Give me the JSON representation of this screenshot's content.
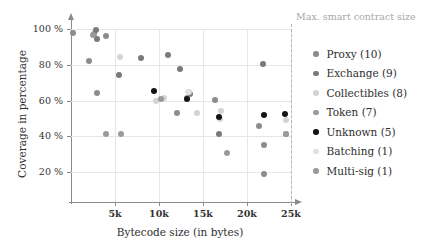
{
  "chart_data": {
    "type": "scatter",
    "title": "",
    "xlabel": "Bytecode size (in bytes)",
    "ylabel": "Coverage in percentage",
    "xlim": [
      0,
      25500
    ],
    "ylim": [
      0,
      108
    ],
    "grid": true,
    "legend_position": "right",
    "xticks": [
      {
        "value": 5000,
        "label": "5k"
      },
      {
        "value": 10000,
        "label": "10k"
      },
      {
        "value": 15000,
        "label": "15k"
      },
      {
        "value": 20000,
        "label": "20k"
      },
      {
        "value": 25000,
        "label": "25k"
      }
    ],
    "yticks": [
      {
        "value": 20,
        "label": "20 %"
      },
      {
        "value": 40,
        "label": "40 %"
      },
      {
        "value": 60,
        "label": "60 %"
      },
      {
        "value": 80,
        "label": "80 %"
      },
      {
        "value": 100,
        "label": "100 %"
      }
    ],
    "annotations": [
      {
        "name": "max-smart-contract-size",
        "text": "Max. smart contract size",
        "type": "vertical-line",
        "x": 25000,
        "color": "#b9b9b9",
        "style": "dashed"
      }
    ],
    "series": [
      {
        "name": "Proxy",
        "count": 10,
        "legend_label": "Proxy (10)",
        "color": "#8c8c8c",
        "points": [
          {
            "x": 250,
            "y": 98
          },
          {
            "x": 2000,
            "y": 82
          },
          {
            "x": 2600,
            "y": 97
          },
          {
            "x": 3000,
            "y": 64
          },
          {
            "x": 4000,
            "y": 96
          },
          {
            "x": 12000,
            "y": 53
          },
          {
            "x": 16400,
            "y": 60.5
          },
          {
            "x": 21400,
            "y": 45.5
          },
          {
            "x": 21900,
            "y": 35
          },
          {
            "x": 21900,
            "y": 19
          }
        ]
      },
      {
        "name": "Exchange",
        "count": 9,
        "legend_label": "Exchange (9)",
        "color": "#7a7a7a",
        "points": [
          {
            "x": 2800,
            "y": 99.5
          },
          {
            "x": 3000,
            "y": 94.5
          },
          {
            "x": 5500,
            "y": 74
          },
          {
            "x": 8000,
            "y": 83.5
          },
          {
            "x": 11000,
            "y": 85.5
          },
          {
            "x": 12400,
            "y": 77.5
          },
          {
            "x": 13500,
            "y": 63.5
          },
          {
            "x": 16800,
            "y": 41
          },
          {
            "x": 21800,
            "y": 80.5
          }
        ]
      },
      {
        "name": "Collectibles",
        "count": 8,
        "legend_label": "Collectibles (8)",
        "color": "#d4d4d4",
        "points": [
          {
            "x": 5600,
            "y": 84.5
          },
          {
            "x": 9700,
            "y": 60
          },
          {
            "x": 10600,
            "y": 61.5
          },
          {
            "x": 13400,
            "y": 64.5
          },
          {
            "x": 14300,
            "y": 53
          },
          {
            "x": 16900,
            "y": 49.5
          },
          {
            "x": 17000,
            "y": 54
          },
          {
            "x": 24400,
            "y": 49
          }
        ]
      },
      {
        "name": "Token",
        "count": 7,
        "legend_label": "Token (7)",
        "color": "#9a9a9a",
        "points": [
          {
            "x": 2500,
            "y": 96.5
          },
          {
            "x": 4000,
            "y": 41
          },
          {
            "x": 5700,
            "y": 41
          },
          {
            "x": 10200,
            "y": 61
          },
          {
            "x": 13200,
            "y": 61.5
          },
          {
            "x": 17700,
            "y": 30.5
          },
          {
            "x": 24400,
            "y": 41
          }
        ]
      },
      {
        "name": "Unknown",
        "count": 5,
        "legend_label": "Unknown (5)",
        "color": "#141414",
        "points": [
          {
            "x": 9400,
            "y": 65.5
          },
          {
            "x": 13200,
            "y": 61
          },
          {
            "x": 16800,
            "y": 50.5
          },
          {
            "x": 21900,
            "y": 52
          },
          {
            "x": 24300,
            "y": 52.5
          }
        ]
      },
      {
        "name": "Batching",
        "count": 1,
        "legend_label": "Batching (1)",
        "color": "#e0e0e0",
        "points": [
          {
            "x": 13300,
            "y": 65
          }
        ]
      },
      {
        "name": "Multi-sig",
        "count": 1,
        "legend_label": "Multi-sig (1)",
        "color": "#9a9a9a",
        "points": [
          {
            "x": 24400,
            "y": 41
          }
        ]
      }
    ]
  }
}
